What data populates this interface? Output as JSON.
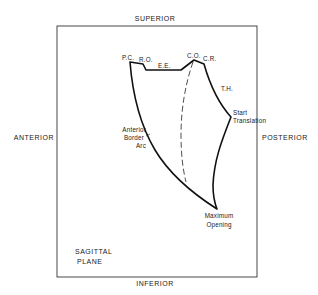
{
  "figure": {
    "axes": {
      "top": "SUPERIOR",
      "bottom": "INFERIOR",
      "left": "ANTERIOR",
      "right": "POSTERIOR"
    },
    "plane": [
      "SAGITTAL",
      "PLANE"
    ],
    "landmarks": {
      "pc": "P.C.",
      "ro": "R.O.",
      "ee": "E.E.",
      "co": "C.O.",
      "cr": "C.R.",
      "th": "T.H."
    },
    "annotations": {
      "start_translation": [
        "Start",
        "Translation"
      ],
      "anterior_border_arc": [
        "Anterior",
        "Border",
        "Arc"
      ],
      "maximum_opening": [
        "Maximum",
        "Opening"
      ]
    },
    "colors": {
      "line": "#111111",
      "frame": "#333333",
      "background": "#ffffff"
    }
  }
}
